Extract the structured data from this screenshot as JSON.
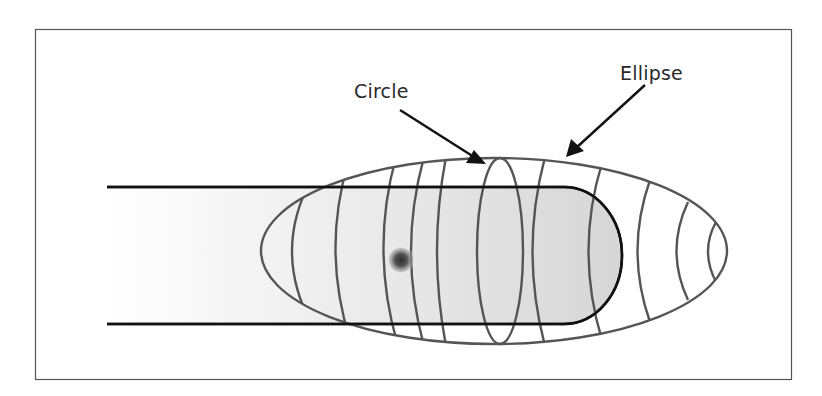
{
  "diagram": {
    "type": "field-pattern-illustration",
    "frame": {
      "x": 35,
      "y": 29,
      "width": 757,
      "height": 351,
      "stroke": "#555555"
    },
    "labels": {
      "circle": "Circle",
      "ellipse": "Ellipse"
    },
    "colors": {
      "background": "#ffffff",
      "bar_fill_light": "#f6f6f6",
      "bar_fill_dark": "#d9d9d9",
      "bar_stroke": "#111111",
      "contour_stroke": "#555555",
      "arrow": "#111111",
      "text": "#2a2a2a",
      "dot": "#333333"
    },
    "bar": {
      "left": 107,
      "top": 187,
      "bottom": 324,
      "right": 622,
      "corner_radius": 58
    },
    "ellipse": {
      "cx": 494,
      "cy": 251,
      "rx": 233,
      "ry": 93
    },
    "circle": {
      "cx": 500,
      "cy": 251,
      "rx": 23,
      "ry": 93
    },
    "dot": {
      "cx": 401,
      "cy": 260,
      "r": 12
    },
    "arrows": [
      {
        "name": "circle-arrow",
        "from": [
          400,
          110
        ],
        "to": [
          484,
          163
        ]
      },
      {
        "name": "ellipse-arrow",
        "from": [
          645,
          85
        ],
        "to": [
          567,
          156
        ]
      }
    ]
  }
}
